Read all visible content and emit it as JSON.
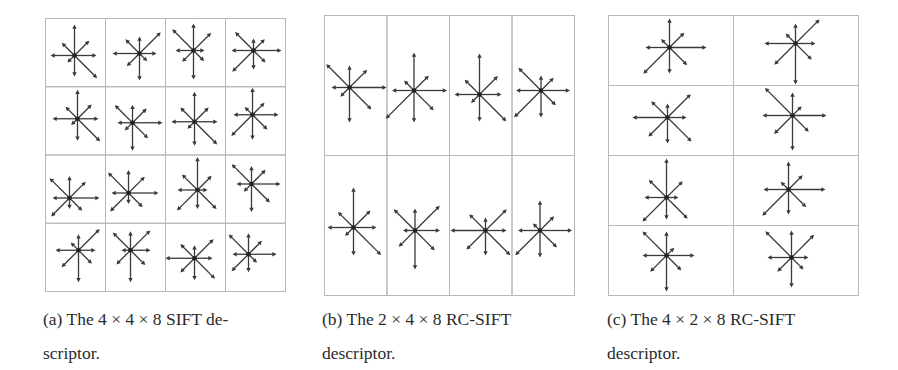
{
  "figures": [
    {
      "id": "a",
      "caption": {
        "line1": "(a) The 4 × 4 × 8 SIFT de-",
        "line2": "scriptor."
      },
      "grid": {
        "rows": 4,
        "cols": 4,
        "x": 45,
        "y": 18,
        "width": 240,
        "height": 273
      },
      "direction_order": [
        "E",
        "NE",
        "N",
        "NW",
        "W",
        "SW",
        "S",
        "SE"
      ],
      "cells": [
        {
          "row": 0,
          "col": 0,
          "cx": 29,
          "cy": 37,
          "len": [
            22,
            21,
            31,
            18,
            24,
            10,
            21,
            32
          ]
        },
        {
          "row": 0,
          "col": 1,
          "cx": 34,
          "cy": 35,
          "len": [
            17,
            30,
            17,
            20,
            27,
            18,
            27,
            11
          ]
        },
        {
          "row": 0,
          "col": 2,
          "cx": 28,
          "cy": 32,
          "len": [
            11,
            25,
            27,
            30,
            18,
            16,
            29,
            15
          ]
        },
        {
          "row": 0,
          "col": 3,
          "cx": 28,
          "cy": 32,
          "len": [
            28,
            16,
            12,
            26,
            22,
            30,
            19,
            17
          ]
        },
        {
          "row": 1,
          "col": 0,
          "cx": 32,
          "cy": 32,
          "len": [
            21,
            20,
            29,
            17,
            25,
            9,
            22,
            32
          ]
        },
        {
          "row": 1,
          "col": 1,
          "cx": 27,
          "cy": 36,
          "len": [
            30,
            20,
            18,
            25,
            15,
            11,
            28,
            22
          ]
        },
        {
          "row": 1,
          "col": 2,
          "cx": 29,
          "cy": 35,
          "len": [
            23,
            20,
            30,
            20,
            23,
            10,
            24,
            32
          ]
        },
        {
          "row": 1,
          "col": 3,
          "cx": 27,
          "cy": 28,
          "len": [
            26,
            17,
            27,
            11,
            19,
            30,
            25,
            21
          ]
        },
        {
          "row": 2,
          "col": 0,
          "cx": 24,
          "cy": 43,
          "len": [
            30,
            23,
            22,
            28,
            17,
            26,
            11,
            18
          ]
        },
        {
          "row": 2,
          "col": 1,
          "cx": 23,
          "cy": 38,
          "len": [
            30,
            23,
            23,
            29,
            17,
            26,
            11,
            20
          ]
        },
        {
          "row": 2,
          "col": 2,
          "cx": 32,
          "cy": 35,
          "len": [
            10,
            20,
            33,
            22,
            20,
            29,
            19,
            27
          ]
        },
        {
          "row": 2,
          "col": 3,
          "cx": 26,
          "cy": 29,
          "len": [
            29,
            20,
            18,
            28,
            15,
            11,
            28,
            26
          ]
        },
        {
          "row": 3,
          "col": 0,
          "cx": 33,
          "cy": 27,
          "len": [
            17,
            30,
            16,
            11,
            23,
            24,
            32,
            19
          ]
        },
        {
          "row": 3,
          "col": 1,
          "cx": 25,
          "cy": 27,
          "len": [
            20,
            28,
            19,
            25,
            9,
            20,
            32,
            21
          ]
        },
        {
          "row": 3,
          "col": 2,
          "cx": 29,
          "cy": 35,
          "len": [
            18,
            27,
            13,
            20,
            29,
            20,
            22,
            29
          ]
        },
        {
          "row": 3,
          "col": 3,
          "cx": 23,
          "cy": 31,
          "len": [
            28,
            19,
            21,
            28,
            16,
            24,
            18,
            12
          ]
        }
      ]
    },
    {
      "id": "b",
      "caption": {
        "line1": "(b) The 2 × 4 × 8 RC-SIFT",
        "line2": "descriptor."
      },
      "grid": {
        "rows": 2,
        "cols": 4,
        "x": 324,
        "y": 15,
        "width": 250,
        "height": 280
      },
      "direction_order": [
        "E",
        "NE",
        "N",
        "NW",
        "W",
        "SW",
        "S",
        "SE"
      ],
      "cells": [
        {
          "row": 0,
          "col": 0,
          "cx": 25,
          "cy": 72,
          "len": [
            37,
            25,
            22,
            33,
            18,
            13,
            35,
            31
          ]
        },
        {
          "row": 0,
          "col": 1,
          "cx": 27,
          "cy": 75,
          "len": [
            33,
            21,
            38,
            14,
            22,
            40,
            32,
            28
          ]
        },
        {
          "row": 0,
          "col": 2,
          "cx": 30,
          "cy": 79,
          "len": [
            22,
            26,
            41,
            21,
            25,
            12,
            27,
            38
          ]
        },
        {
          "row": 0,
          "col": 3,
          "cx": 29,
          "cy": 75,
          "len": [
            29,
            18,
            15,
            32,
            25,
            38,
            27,
            21
          ]
        },
        {
          "row": 1,
          "col": 0,
          "cx": 29,
          "cy": 72,
          "len": [
            23,
            24,
            40,
            22,
            26,
            12,
            28,
            39
          ]
        },
        {
          "row": 1,
          "col": 1,
          "cx": 28,
          "cy": 75,
          "len": [
            25,
            35,
            22,
            30,
            12,
            23,
            39,
            28
          ]
        },
        {
          "row": 1,
          "col": 2,
          "cx": 36,
          "cy": 75,
          "len": [
            21,
            30,
            13,
            23,
            35,
            27,
            25,
            35
          ]
        },
        {
          "row": 1,
          "col": 3,
          "cx": 28,
          "cy": 75,
          "len": [
            32,
            20,
            30,
            10,
            22,
            35,
            27,
            24
          ]
        }
      ]
    },
    {
      "id": "c",
      "caption": {
        "line1": "(c) The 4 × 2 × 8 RC-SIFT",
        "line2": "descriptor."
      },
      "grid": {
        "rows": 4,
        "cols": 2,
        "x": 608,
        "y": 15,
        "width": 250,
        "height": 280
      },
      "direction_order": [
        "E",
        "NE",
        "N",
        "NW",
        "W",
        "SW",
        "S",
        "SE"
      ],
      "cells": [
        {
          "row": 0,
          "col": 0,
          "cx": 61,
          "cy": 32,
          "len": [
            37,
            21,
            29,
            12,
            24,
            37,
            26,
            25
          ]
        },
        {
          "row": 0,
          "col": 1,
          "cx": 62,
          "cy": 28,
          "len": [
            20,
            34,
            20,
            14,
            31,
            30,
            41,
            23
          ]
        },
        {
          "row": 1,
          "col": 0,
          "cx": 59,
          "cy": 32,
          "len": [
            19,
            33,
            14,
            23,
            35,
            27,
            26,
            34
          ]
        },
        {
          "row": 1,
          "col": 1,
          "cx": 59,
          "cy": 30,
          "len": [
            34,
            13,
            23,
            39,
            30,
            26,
            35,
            23
          ]
        },
        {
          "row": 2,
          "col": 0,
          "cx": 58,
          "cy": 42,
          "len": [
            12,
            23,
            39,
            25,
            22,
            34,
            22,
            30
          ]
        },
        {
          "row": 2,
          "col": 1,
          "cx": 55,
          "cy": 34,
          "len": [
            37,
            20,
            28,
            11,
            25,
            37,
            25,
            25
          ]
        },
        {
          "row": 3,
          "col": 0,
          "cx": 58,
          "cy": 30,
          "len": [
            28,
            11,
            24,
            34,
            24,
            23,
            36,
            21
          ]
        },
        {
          "row": 3,
          "col": 1,
          "cx": 58,
          "cy": 32,
          "len": [
            17,
            32,
            27,
            37,
            24,
            20,
            30,
            17
          ]
        }
      ]
    }
  ],
  "colors": {
    "grid_line": "#b8b8b8",
    "arrow": "#3a3a3a",
    "background": "#ffffff",
    "caption_text": "#2b2b2b"
  },
  "captions_layout": [
    {
      "id": "a",
      "x": 43,
      "y": 302
    },
    {
      "id": "b",
      "x": 322,
      "y": 302
    },
    {
      "id": "c",
      "x": 607,
      "y": 302
    }
  ]
}
